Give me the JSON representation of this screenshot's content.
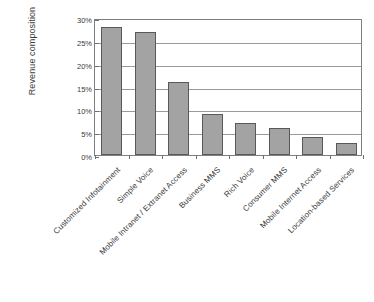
{
  "chart_data": {
    "type": "bar",
    "title": "",
    "xlabel": "",
    "ylabel": "Revenue composition",
    "categories": [
      "Customized Infotainment",
      "Simple Voice",
      "Mobile Intranet / Extranet Access",
      "Business MMS",
      "Rich Voice",
      "Consumer MMS",
      "Mobile Internet Access",
      "Location-based Services"
    ],
    "values": [
      28,
      27,
      16,
      9,
      7,
      6,
      4,
      2.6
    ],
    "value_labels": [
      "28%",
      "27%",
      "16%",
      "9%",
      "7%",
      "6%",
      "4%",
      "2.6%"
    ],
    "ylim": [
      0,
      30
    ],
    "ytick_values": [
      0,
      5,
      10,
      15,
      20,
      25,
      30
    ],
    "ytick_labels": [
      "0%",
      "5%",
      "10%",
      "15%",
      "20%",
      "25%",
      "30%"
    ],
    "grid": "horizontal",
    "legend": "none",
    "bar_color": "#a3a3a3",
    "bar_border_color": "#595959",
    "gridline_color": "#9a9a9a",
    "axis_color": "#808080",
    "background_color": "#ffffff",
    "text_color": "#3a3a3a",
    "xtick_label_rotation": -45
  }
}
